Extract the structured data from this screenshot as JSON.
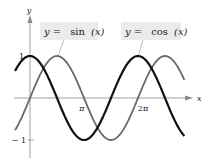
{
  "chart_data": {
    "type": "line",
    "title": "",
    "xlabel": "x",
    "ylabel": "y",
    "xlim": [
      -0.87,
      9.0
    ],
    "ylim": [
      -1.2,
      1.2
    ],
    "x_ticks": [
      {
        "value": 3.14159,
        "label": "π"
      },
      {
        "value": 6.28319,
        "label": "2π"
      }
    ],
    "y_ticks": [
      {
        "value": 1,
        "label": "1"
      },
      {
        "value": -1,
        "label": "− 1"
      }
    ],
    "grid": false,
    "series": [
      {
        "name": "y = sin (x)",
        "function": "sin(x)",
        "color": "#6a6a6a",
        "x_range": [
          -0.87,
          9.0
        ]
      },
      {
        "name": "y = cos (x)",
        "function": "cos(x)",
        "color": "#111111",
        "x_range": [
          -0.87,
          9.0
        ]
      }
    ],
    "annotations": [
      {
        "text": "y =  sin (x)",
        "points_to": "sin"
      },
      {
        "text": "y =  cos (x)",
        "points_to": "cos"
      }
    ]
  },
  "labels": {
    "sin_eq_lhs": "y =",
    "sin_eq_rhs": "sin",
    "sin_eq_arg": "(x)",
    "cos_eq_lhs": "y =",
    "cos_eq_rhs": "cos",
    "cos_eq_arg": "(x)",
    "x_axis": "x",
    "y_axis": "y",
    "tick_pi": "π",
    "tick_2pi": "2π",
    "tick_1": "1",
    "tick_neg1": "− 1"
  },
  "colors": {
    "sin": "#6a6a6a",
    "cos": "#111111",
    "axis": "#888888",
    "label_bg": "#ebebeb"
  }
}
